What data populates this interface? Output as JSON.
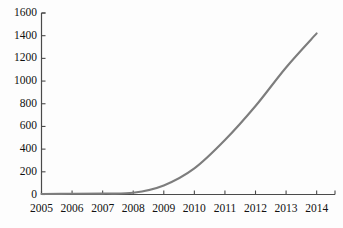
{
  "chart_data": {
    "type": "line",
    "title": "",
    "subtitle": "",
    "xlabel": "",
    "ylabel": "",
    "x": [
      2005,
      2006,
      2007,
      2008,
      2009,
      2010,
      2011,
      2012,
      2013,
      2014
    ],
    "categories": [
      "2005",
      "2006",
      "2007",
      "2008",
      "2009",
      "2010",
      "2011",
      "2012",
      "2013",
      "2014"
    ],
    "values": [
      5,
      6,
      8,
      15,
      80,
      230,
      480,
      780,
      1120,
      1420
    ],
    "series": [
      {
        "name": "series-1",
        "color": "#7d7d7d",
        "values": [
          5,
          6,
          8,
          15,
          80,
          230,
          480,
          780,
          1120,
          1420
        ]
      }
    ],
    "xlim": [
      2005,
      2014.6
    ],
    "ylim": [
      0,
      1600
    ],
    "ytick_values": [
      0,
      200,
      400,
      600,
      800,
      1000,
      1200,
      1400,
      1600
    ],
    "ytick_labels": [
      "0",
      "200",
      "400",
      "600",
      "800",
      "1000",
      "1200",
      "1400",
      "1600"
    ],
    "xtick_labels": [
      "2005",
      "2006",
      "2007",
      "2008",
      "2009",
      "2010",
      "2011",
      "2012",
      "2013",
      "2014"
    ],
    "grid": false,
    "legend": false,
    "legend_position": "none",
    "annotations": []
  },
  "style": {
    "axis_color": "#4a4a4a",
    "line_color": "#7d7d7d",
    "text_color": "#111111",
    "background": "#fdfdfd"
  }
}
